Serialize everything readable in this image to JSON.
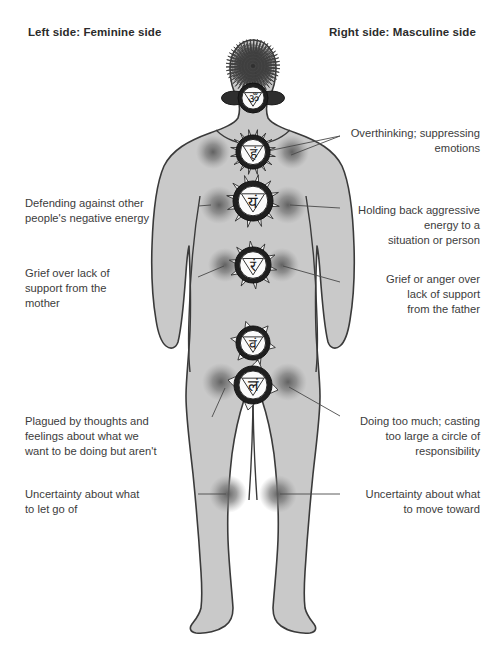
{
  "page": {
    "background_color": "#ffffff",
    "body_fill": "#c9c9c9",
    "body_stroke": "#3a3a3a",
    "text_color": "#3c3c3c",
    "dot_color": "#6e6e6e",
    "leader_color": "#4a4a4a"
  },
  "headers": {
    "left": "Left side: Feminine side",
    "right": "Right side: Masculine side"
  },
  "annotations_left": [
    {
      "id": "defending",
      "text": "Defending against other\npeople's negative energy",
      "x": 25,
      "y": 196,
      "width": 170
    },
    {
      "id": "grief-mother",
      "text": "Grief over lack of\nsupport from the\nmother",
      "x": 25,
      "y": 266,
      "width": 170
    },
    {
      "id": "plagued",
      "text": "Plagued by thoughts and\nfeelings about what we\nwant to be doing but aren't",
      "x": 25,
      "y": 414,
      "width": 180
    },
    {
      "id": "uncertainty-let-go",
      "text": "Uncertainty about what\nto let go of",
      "x": 25,
      "y": 487,
      "width": 175
    }
  ],
  "annotations_right": [
    {
      "id": "overthinking",
      "text": "Overthinking; suppressing\nemotions",
      "x": 348,
      "y": 126,
      "width": 132
    },
    {
      "id": "holding-back",
      "text": "Holding back aggressive\nenergy to a\nsituation or person",
      "x": 348,
      "y": 203,
      "width": 132
    },
    {
      "id": "grief-father",
      "text": "Grief or anger over\nlack of support\nfrom the father",
      "x": 348,
      "y": 272,
      "width": 132
    },
    {
      "id": "doing-too-much",
      "text": "Doing too much; casting\ntoo large a circle of\nresponsibility",
      "x": 348,
      "y": 414,
      "width": 132
    },
    {
      "id": "uncertainty-move-toward",
      "text": "Uncertainty about what\nto move toward",
      "x": 348,
      "y": 487,
      "width": 132
    }
  ],
  "chakras": [
    {
      "id": "crown",
      "name": "sahasrara-crown-chakra",
      "cx": 253,
      "cy": 66,
      "r": 27,
      "glyph": "",
      "style": "radial-petals"
    },
    {
      "id": "third-eye",
      "name": "ajna-third-eye-chakra",
      "cx": 253,
      "cy": 98,
      "r": 15,
      "glyph": "ॐ",
      "style": "two-petal"
    },
    {
      "id": "throat",
      "name": "vishuddha-throat-chakra",
      "cx": 253,
      "cy": 152,
      "r": 17,
      "glyph": "हं",
      "style": "many-petal"
    },
    {
      "id": "heart",
      "name": "anahata-heart-chakra",
      "cx": 253,
      "cy": 201,
      "r": 20,
      "glyph": "यं",
      "style": "twelve-petal"
    },
    {
      "id": "solar-plexus",
      "name": "manipura-solar-plexus-chakra",
      "cx": 253,
      "cy": 265,
      "r": 18,
      "glyph": "रं",
      "style": "ten-petal"
    },
    {
      "id": "sacral",
      "name": "svadhisthana-sacral-chakra",
      "cx": 253,
      "cy": 343,
      "r": 17,
      "glyph": "वं",
      "style": "six-petal"
    },
    {
      "id": "root",
      "name": "muladhara-root-chakra",
      "cx": 253,
      "cy": 385,
      "r": 19,
      "glyph": "लं",
      "style": "four-petal"
    }
  ],
  "energy_dots": [
    {
      "id": "left-shoulder",
      "cx": 213,
      "cy": 152,
      "r": 9
    },
    {
      "id": "right-shoulder",
      "cx": 292,
      "cy": 152,
      "r": 9
    },
    {
      "id": "left-chest",
      "cx": 219,
      "cy": 205,
      "r": 10
    },
    {
      "id": "right-chest",
      "cx": 288,
      "cy": 205,
      "r": 10
    },
    {
      "id": "left-waist",
      "cx": 225,
      "cy": 265,
      "r": 9
    },
    {
      "id": "right-waist",
      "cx": 282,
      "cy": 265,
      "r": 9
    },
    {
      "id": "left-hip",
      "cx": 221,
      "cy": 382,
      "r": 10
    },
    {
      "id": "right-hip",
      "cx": 288,
      "cy": 382,
      "r": 10
    },
    {
      "id": "left-knee",
      "cx": 228,
      "cy": 494,
      "r": 10
    },
    {
      "id": "right-knee",
      "cx": 278,
      "cy": 494,
      "r": 10
    }
  ],
  "leader_lines": [
    {
      "id": "defending-line",
      "x1": 198,
      "y1": 206,
      "x2": 211,
      "y2": 205
    },
    {
      "id": "grief-mother-line",
      "x1": 198,
      "y1": 277,
      "x2": 224,
      "y2": 266
    },
    {
      "id": "plagued-line",
      "x1": 212,
      "y1": 417,
      "x2": 225,
      "y2": 388
    },
    {
      "id": "uncertainty-letgo-line",
      "x1": 198,
      "y1": 494,
      "x2": 226,
      "y2": 494
    },
    {
      "id": "overthinking-line-a",
      "x1": 340,
      "y1": 136,
      "x2": 263,
      "y2": 152
    },
    {
      "id": "overthinking-line-b",
      "x1": 340,
      "y1": 136,
      "x2": 291,
      "y2": 155
    },
    {
      "id": "holding-back-line",
      "x1": 340,
      "y1": 208,
      "x2": 290,
      "y2": 205
    },
    {
      "id": "grief-father-line",
      "x1": 340,
      "y1": 282,
      "x2": 283,
      "y2": 266
    },
    {
      "id": "doing-too-much-line",
      "x1": 340,
      "y1": 416,
      "x2": 289,
      "y2": 387
    },
    {
      "id": "uncertainty-toward-line",
      "x1": 340,
      "y1": 494,
      "x2": 280,
      "y2": 494
    }
  ]
}
